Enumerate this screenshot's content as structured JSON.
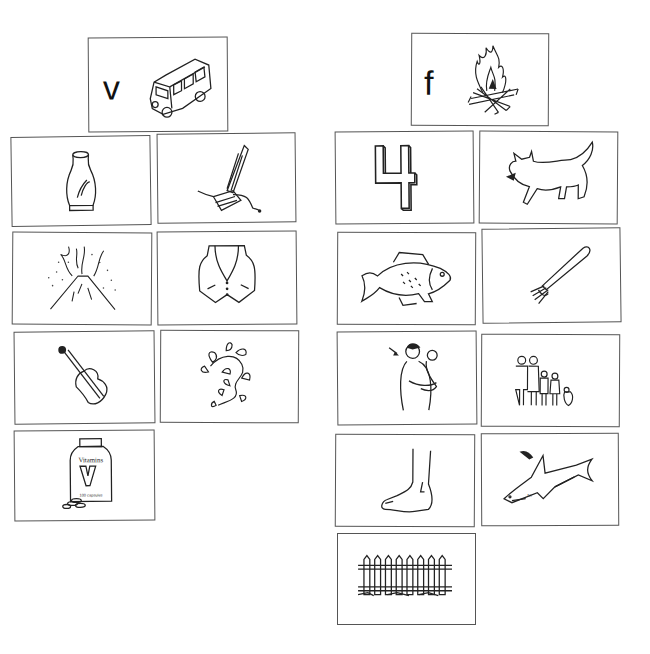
{
  "worksheet": {
    "columns": [
      {
        "letter": "v",
        "header_picture": "van",
        "pictures": [
          "vase",
          "vacuum",
          "volcano",
          "vest",
          "violin",
          "vine",
          "vitamins"
        ]
      },
      {
        "letter": "f",
        "header_picture": "fire",
        "pictures": [
          "four",
          "fox",
          "fish",
          "fork",
          "father",
          "family",
          "foot",
          "fin",
          "fence"
        ]
      }
    ],
    "vitamin_label": "Vitamins",
    "vitamin_letter": "V",
    "vitamin_count": "100 capsules",
    "fin_tag": "fin"
  }
}
